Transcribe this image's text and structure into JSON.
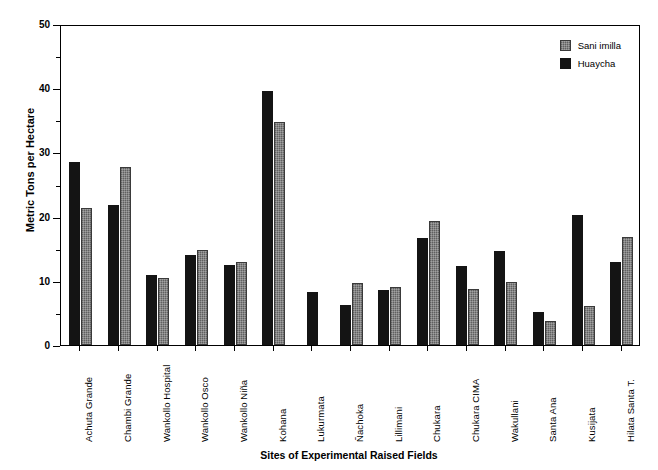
{
  "chart_data": {
    "type": "bar",
    "title": "",
    "xlabel": "Sites of Experimental Raised Fields",
    "ylabel": "Metric Tons per Hectare",
    "ylim": [
      0,
      50
    ],
    "yticks": [
      0,
      10,
      20,
      30,
      40,
      50
    ],
    "yminorticks": [
      5,
      15,
      25,
      35,
      45
    ],
    "grid": false,
    "legend_position": "top-right",
    "categories": [
      "Achuta Grande",
      "Chambi Grande",
      "Wankollo Hospital",
      "Wankollo Osco",
      "Wankollo Niña",
      "Kohana",
      "Lukurmata",
      "Ñachoka",
      "Lillimani",
      "Chukara",
      "Chukara CIMA",
      "Wakullani",
      "Santa Ana",
      "Kusijata",
      "Hilata Santa T."
    ],
    "series": [
      {
        "name": "Huaycha",
        "color": "#141414",
        "values": [
          28.5,
          21.8,
          10.9,
          14.0,
          12.4,
          39.6,
          8.3,
          6.2,
          8.6,
          16.7,
          12.3,
          14.6,
          5.2,
          20.3,
          12.9
        ]
      },
      {
        "name": "Sani imilla",
        "color": "#787878",
        "values": [
          21.4,
          27.7,
          10.4,
          14.8,
          12.9,
          34.8,
          null,
          9.7,
          9.0,
          19.3,
          8.8,
          9.8,
          3.7,
          6.0,
          16.8
        ]
      }
    ]
  },
  "legend": {
    "items": [
      {
        "label": "Sani imilla",
        "swatch": "sani"
      },
      {
        "label": "Huaycha",
        "swatch": "huaycha"
      }
    ]
  },
  "caption": ""
}
